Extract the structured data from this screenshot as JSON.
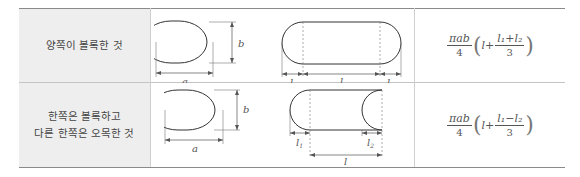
{
  "rows": [
    {
      "label_lines": [
        "양쪽이 볼록한 것"
      ],
      "figure1": {
        "width_label": "a",
        "height_label": "b"
      },
      "figure2": {
        "dims": [
          "l1",
          "l",
          "l2"
        ]
      },
      "formula": {
        "prefix_num": "πab",
        "prefix_den": "4",
        "inner_var": "l",
        "plus": "+",
        "frac_num": "l₁+l₂",
        "frac_den": "3"
      }
    },
    {
      "label_lines": [
        "한쪽은 볼록하고",
        "다른 한쪽은 오목한 것"
      ],
      "figure1": {
        "width_label": "a",
        "height_label": "b"
      },
      "figure2": {
        "dims": [
          "l1",
          "l2",
          "l"
        ]
      },
      "formula": {
        "prefix_num": "πab",
        "prefix_den": "4",
        "inner_var": "l",
        "plus": "+",
        "frac_num": "l₁−l₂",
        "frac_den": "3"
      }
    }
  ],
  "svg_labels": {
    "a": "a",
    "b": "b",
    "l": "l",
    "l1_base": "l",
    "l1_sub": "1",
    "l2_base": "l",
    "l2_sub": "2"
  }
}
